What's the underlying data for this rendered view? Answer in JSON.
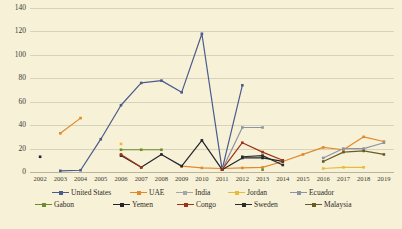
{
  "chart_data": {
    "type": "line",
    "title": "",
    "xlabel": "",
    "ylabel": "",
    "ylim": [
      0,
      140
    ],
    "ytick_step": 20,
    "yticks": [
      "0",
      "20",
      "40",
      "60",
      "80",
      "100",
      "120",
      "140"
    ],
    "grid": true,
    "legend_position": "bottom",
    "categories": [
      "2002",
      "2003",
      "2004",
      "2005",
      "2006",
      "2007",
      "2008",
      "2009",
      "2010",
      "2011",
      "2012",
      "2013",
      "2014",
      "2015",
      "2016",
      "2017",
      "2018",
      "2019"
    ],
    "series": [
      {
        "name": "United States",
        "color": "#4a5b8c",
        "values": [
          null,
          1,
          1.5,
          28,
          57,
          76,
          78,
          68,
          118,
          2,
          74,
          null,
          null,
          null,
          null,
          null,
          null,
          null
        ]
      },
      {
        "name": "UAE",
        "color": "#e08a2e",
        "values": [
          null,
          33,
          46,
          null,
          null,
          null,
          null,
          5,
          3.5,
          3,
          3.5,
          4,
          9,
          15,
          21,
          19,
          30,
          26
        ]
      },
      {
        "name": "India",
        "color": "#a6a6a6",
        "values": [
          null,
          null,
          null,
          null,
          null,
          null,
          null,
          null,
          null,
          null,
          null,
          null,
          null,
          null,
          null,
          null,
          null,
          null
        ]
      },
      {
        "name": "Jordan",
        "color": "#e8bb3b",
        "values": [
          null,
          null,
          null,
          null,
          24,
          null,
          null,
          null,
          null,
          null,
          null,
          null,
          null,
          null,
          3,
          4,
          4,
          null
        ]
      },
      {
        "name": "Ecuador",
        "color": "#8b95a6",
        "values": [
          null,
          null,
          null,
          null,
          null,
          null,
          null,
          null,
          null,
          2,
          38,
          38,
          null,
          null,
          12,
          20,
          20,
          25
        ]
      },
      {
        "name": "Gabon",
        "color": "#6f8c2a",
        "values": [
          null,
          null,
          null,
          null,
          19,
          19,
          19,
          null,
          null,
          null,
          null,
          2,
          null,
          null,
          null,
          null,
          null,
          null
        ]
      },
      {
        "name": "Yemen",
        "color": "#23252e",
        "values": [
          13,
          null,
          null,
          null,
          14,
          4,
          15,
          5,
          27,
          2,
          12,
          12,
          9,
          null,
          null,
          null,
          null,
          null
        ]
      },
      {
        "name": "Congo",
        "color": "#9c3316",
        "values": [
          null,
          null,
          null,
          null,
          15,
          4,
          null,
          null,
          null,
          2,
          25,
          17,
          10,
          null,
          null,
          null,
          null,
          null
        ]
      },
      {
        "name": "Sweden",
        "color": "#2b2b2b",
        "values": [
          null,
          null,
          null,
          null,
          null,
          null,
          null,
          null,
          null,
          null,
          13,
          14,
          6,
          null,
          null,
          null,
          null,
          null
        ]
      },
      {
        "name": "Malaysia",
        "color": "#6b5b26",
        "values": [
          null,
          null,
          null,
          null,
          null,
          null,
          null,
          null,
          null,
          null,
          null,
          null,
          null,
          null,
          9,
          17,
          18,
          15
        ]
      }
    ]
  },
  "legend": {
    "rows": [
      [
        "United States",
        "UAE",
        "India",
        "Jordan",
        "Ecuador"
      ],
      [
        "Gabon",
        "Yemen",
        "Congo",
        "Sweden",
        "Malaysia"
      ]
    ]
  }
}
